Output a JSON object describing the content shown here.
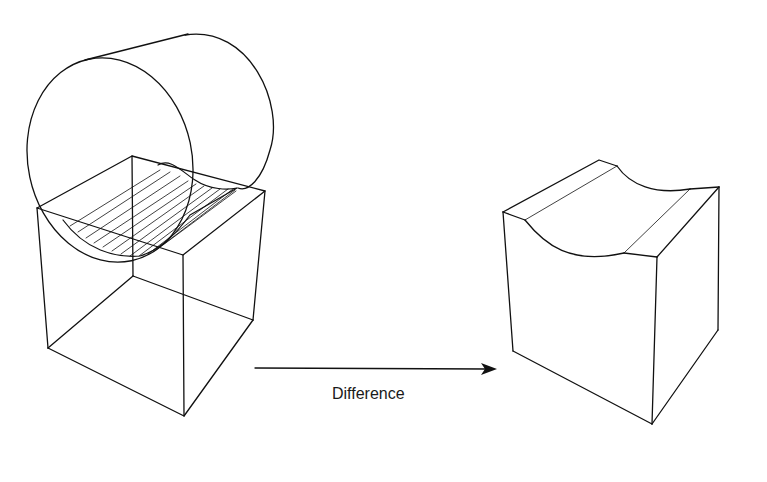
{
  "diagram": {
    "title": "",
    "operation_label": "Difference",
    "left_figure": {
      "name": "Cylinder intersecting cube",
      "objects": [
        "cylinder",
        "cube"
      ],
      "hatched_region": "intersection surface"
    },
    "right_figure": {
      "name": "Cube with cylindrical groove",
      "objects": [
        "grooved-cube"
      ]
    },
    "arrow": {
      "direction": "right",
      "from": "left_figure",
      "to": "right_figure"
    },
    "colors": {
      "stroke": "#111111",
      "background": "#ffffff"
    }
  }
}
